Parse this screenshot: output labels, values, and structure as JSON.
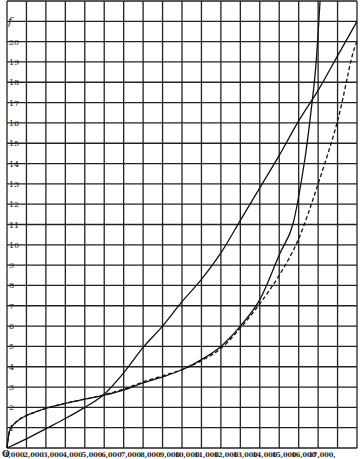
{
  "chart_data": {
    "type": "line",
    "title": "",
    "xlabel": "",
    "ylabel": "f",
    "xlim": [
      0,
      18000
    ],
    "ylim": [
      0,
      22
    ],
    "grid": true,
    "legend": null,
    "x_ticks": [
      {
        "value": 0,
        "label": "O"
      },
      {
        "value": 1000,
        "label": "1,000"
      },
      {
        "value": 2000,
        "label": "2,000"
      },
      {
        "value": 3000,
        "label": "3,000"
      },
      {
        "value": 4000,
        "label": "4,000"
      },
      {
        "value": 5000,
        "label": "5,000"
      },
      {
        "value": 6000,
        "label": "6,000"
      },
      {
        "value": 7000,
        "label": "7,000"
      },
      {
        "value": 8000,
        "label": "8,000"
      },
      {
        "value": 9000,
        "label": "9,000"
      },
      {
        "value": 10000,
        "label": "10,000"
      },
      {
        "value": 11000,
        "label": "11,000"
      },
      {
        "value": 12000,
        "label": "12,000"
      },
      {
        "value": 13000,
        "label": "13,000"
      },
      {
        "value": 14000,
        "label": "14,000"
      },
      {
        "value": 15000,
        "label": "15,000"
      },
      {
        "value": 16000,
        "label": "16,000"
      },
      {
        "value": 17000,
        "label": "17,000"
      }
    ],
    "y_ticks": [
      1,
      2,
      3,
      4,
      5,
      6,
      7,
      8,
      9,
      10,
      11,
      12,
      13,
      14,
      15,
      16,
      17,
      18,
      19,
      20
    ],
    "series": [
      {
        "name": "curve-a-solid-diagonal",
        "style": "solid",
        "points": [
          [
            0,
            0
          ],
          [
            1000,
            0.45
          ],
          [
            2000,
            0.95
          ],
          [
            3000,
            1.45
          ],
          [
            4000,
            2.0
          ],
          [
            5000,
            2.65
          ],
          [
            6000,
            3.7
          ],
          [
            7000,
            4.95
          ],
          [
            8000,
            6.0
          ],
          [
            9000,
            7.2
          ],
          [
            10000,
            8.3
          ],
          [
            11000,
            9.6
          ],
          [
            12000,
            11.2
          ],
          [
            13000,
            12.8
          ],
          [
            14000,
            14.4
          ],
          [
            15000,
            16.1
          ],
          [
            16000,
            17.6
          ],
          [
            17000,
            19.3
          ],
          [
            18000,
            21.0
          ]
        ]
      },
      {
        "name": "curve-b-solid-steep",
        "style": "solid",
        "points": [
          [
            0,
            0
          ],
          [
            150,
            0.9
          ],
          [
            500,
            1.3
          ],
          [
            1000,
            1.6
          ],
          [
            2000,
            1.95
          ],
          [
            3000,
            2.2
          ],
          [
            4000,
            2.4
          ],
          [
            5000,
            2.6
          ],
          [
            6000,
            2.85
          ],
          [
            7000,
            3.2
          ],
          [
            8000,
            3.5
          ],
          [
            9000,
            3.85
          ],
          [
            10000,
            4.35
          ],
          [
            11000,
            5.0
          ],
          [
            12000,
            6.0
          ],
          [
            13000,
            7.3
          ],
          [
            14000,
            9.5
          ],
          [
            14700,
            11.0
          ],
          [
            15300,
            14.1
          ],
          [
            15700,
            17.1
          ],
          [
            15900,
            19.0
          ],
          [
            16100,
            22.0
          ]
        ]
      },
      {
        "name": "curve-c-dashed",
        "style": "dashed",
        "points": [
          [
            0,
            0
          ],
          [
            150,
            0.9
          ],
          [
            500,
            1.3
          ],
          [
            1000,
            1.6
          ],
          [
            2000,
            1.95
          ],
          [
            3000,
            2.2
          ],
          [
            4000,
            2.4
          ],
          [
            5000,
            2.62
          ],
          [
            6000,
            2.9
          ],
          [
            7000,
            3.25
          ],
          [
            8000,
            3.55
          ],
          [
            9000,
            3.85
          ],
          [
            10000,
            4.3
          ],
          [
            11000,
            4.9
          ],
          [
            12000,
            5.9
          ],
          [
            13000,
            7.1
          ],
          [
            14000,
            8.5
          ],
          [
            15000,
            10.3
          ],
          [
            16000,
            13.0
          ],
          [
            17000,
            16.1
          ],
          [
            17700,
            19.1
          ],
          [
            18000,
            20.0
          ]
        ]
      }
    ]
  }
}
